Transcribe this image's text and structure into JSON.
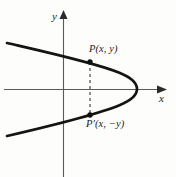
{
  "figure": {
    "kind": "parabola-symmetry-diagram",
    "background_color": "#fdfdfc",
    "ink_color": "#1b1b1b",
    "axis_color": "#5a5a5a",
    "axes": {
      "x_axis_label": "x",
      "y_axis_label": "y",
      "x_axis_y_px": 89,
      "y_axis_x_px": 63,
      "x_axis_from_px": 4,
      "x_axis_to_px": 166,
      "y_axis_from_px": 12,
      "y_axis_to_px": 177,
      "x_arrow": "right-arrowhead",
      "y_arrow": "up-arrowhead"
    },
    "curve": {
      "description": "leftward-opening parabola",
      "vertex_px": [
        137,
        89
      ],
      "upper_end_px": [
        7,
        43
      ],
      "lower_end_px": [
        7,
        136
      ],
      "stroke_width": 2.6
    },
    "points": [
      {
        "id": "P",
        "label": "P(x, y)",
        "marker_px": [
          90,
          62
        ],
        "label_px": [
          89,
          44
        ]
      },
      {
        "id": "P-prime",
        "label": "P′(x, −y)",
        "marker_px": [
          90,
          115
        ],
        "label_px": [
          86,
          119
        ]
      }
    ],
    "connector": {
      "style": "dashed",
      "from_px": [
        90,
        62
      ],
      "to_px": [
        90,
        115
      ],
      "dash_pattern": "3 3"
    }
  }
}
